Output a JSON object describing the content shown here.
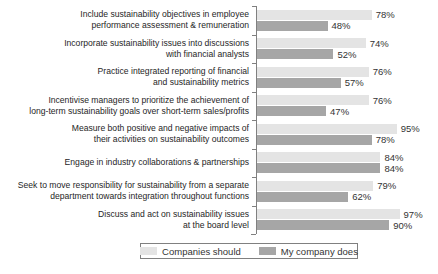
{
  "chart_data": {
    "type": "bar",
    "orientation": "horizontal",
    "title": "",
    "xlabel": "",
    "ylabel": "",
    "unit": "%",
    "xlim": [
      0,
      100
    ],
    "grid": false,
    "legend_position": "bottom",
    "categories": [
      "Include sustainability objectives in employee performance assessment & remuneration",
      "Incorporate sustainability issues into discussions with financial analysts",
      "Practice integrated reporting of financial and sustainability metrics",
      "Incentivise managers to prioritize the achievement of long-term sustainability goals over short-term sales/profits",
      "Measure both positive and negative impacts of their activities on sustainability outcomes",
      "Engage in industry collaborations & partnerships",
      "Seek to move responsibility for sustainability from a separate department towards integration throughout functions",
      "Discuss and act on sustainability issues at the board level"
    ],
    "series": [
      {
        "name": "Companies should",
        "color": "#e4e4e4",
        "values": [
          78,
          74,
          76,
          76,
          95,
          84,
          79,
          97
        ],
        "labels": [
          "78%",
          "74%",
          "76%",
          "76%",
          "95%",
          "84%",
          "79%",
          "97%"
        ]
      },
      {
        "name": "My company does",
        "color": "#a6a6a6",
        "values": [
          48,
          52,
          57,
          47,
          78,
          84,
          62,
          90
        ],
        "labels": [
          "48%",
          "52%",
          "57%",
          "47%",
          "78%",
          "84%",
          "62%",
          "90%"
        ]
      }
    ]
  },
  "rows": [
    {
      "lines": [
        "Include sustainability objectives in employee",
        "performance assessment & remuneration"
      ]
    },
    {
      "lines": [
        "Incorporate sustainability issues into discussions",
        "with financial analysts"
      ]
    },
    {
      "lines": [
        "Practice integrated reporting of financial",
        "and sustainability metrics"
      ]
    },
    {
      "lines": [
        "Incentivise managers to prioritize the achievement of",
        "long-term sustainability goals over short-term sales/profits"
      ]
    },
    {
      "lines": [
        "Measure both positive and negative impacts of",
        "their activities on sustainability outcomes"
      ]
    },
    {
      "lines": [
        "Engage in industry collaborations & partnerships"
      ]
    },
    {
      "lines": [
        "Seek to move responsibility for sustainability from a separate",
        "department towards integration throughout functions"
      ]
    },
    {
      "lines": [
        "Discuss and act on sustainability issues",
        "at the board level"
      ]
    }
  ],
  "colors": {
    "axis": "#808080",
    "category_text": "#262626",
    "value_text": "#333333",
    "legend_border": "#808080",
    "background": "#ffffff"
  }
}
